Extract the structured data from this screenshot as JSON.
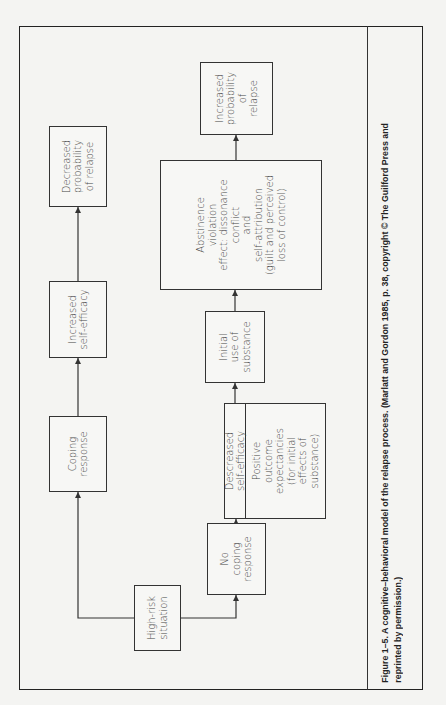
{
  "diagram": {
    "nodes": {
      "high_risk": [
        "High-risk",
        "situation"
      ],
      "coping_response": [
        "Coping",
        "response"
      ],
      "increased_self_efficacy": [
        "Increased",
        "self-efficacy"
      ],
      "decreased_probability": [
        "Decreased",
        "probability",
        "of relapse"
      ],
      "no_coping_response": [
        "No",
        "coping",
        "response"
      ],
      "decreased_self_efficacy": [
        "Descreased",
        "self-efficacy"
      ],
      "positive_outcome": [
        "Positive",
        "outcome",
        "expectancies",
        "(for initial",
        "effects of",
        "substance)"
      ],
      "initial_use": [
        "Initial",
        "use of",
        "substance"
      ],
      "abstinence_violation": [
        "Abstinence",
        "violation",
        "effect: dissonance",
        "conflict",
        "and",
        "self-attribution",
        "(guilt and perceived",
        "loss of control)"
      ],
      "increased_probability": [
        "Increased",
        "probability",
        "of",
        "relapse"
      ]
    },
    "edges": [
      [
        "high_risk",
        "coping_response"
      ],
      [
        "coping_response",
        "increased_self_efficacy"
      ],
      [
        "increased_self_efficacy",
        "decreased_probability"
      ],
      [
        "high_risk",
        "no_coping_response"
      ],
      [
        "no_coping_response",
        "decreased_self_efficacy"
      ],
      [
        "decreased_self_efficacy",
        "initial_use"
      ],
      [
        "initial_use",
        "abstinence_violation"
      ],
      [
        "abstinence_violation",
        "increased_probability"
      ]
    ],
    "caption": "Figure 1–5. A cognitive–behavioral model of the relapse process. (Marlatt and Gordon 1985, p. 38, copyright © The Guilford Press and reprinted by permission.)"
  },
  "colors": {
    "ink": "#333333",
    "paper": "#f4f4f2"
  }
}
